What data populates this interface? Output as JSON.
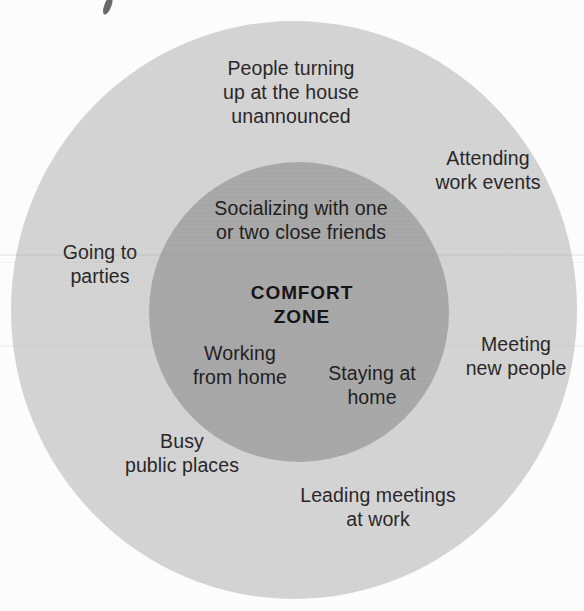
{
  "figure": {
    "type": "concentric-circle-diagram",
    "title": "COMFORT ZONE",
    "colors": {
      "background": "#ffffff",
      "outer_ring_fill": "#d5d5d5",
      "inner_circle_fill": "#a9a9a9",
      "text": "#231f20"
    }
  },
  "center_label": "COMFORT\nZONE",
  "inner_zone": {
    "name": "COMFORT ZONE",
    "items": [
      {
        "id": "socializing",
        "text": "Socializing with one\nor two close friends"
      },
      {
        "id": "working-from-home",
        "text": "Working\nfrom home"
      },
      {
        "id": "staying-at-home",
        "text": "Staying at\nhome"
      }
    ]
  },
  "outer_zone": {
    "items": [
      {
        "id": "people-turning-up",
        "text": "People turning\nup at the house\nunannounced"
      },
      {
        "id": "attending-work-events",
        "text": "Attending\nwork events"
      },
      {
        "id": "going-to-parties",
        "text": "Going to\nparties"
      },
      {
        "id": "meeting-new-people",
        "text": "Meeting\nnew people"
      },
      {
        "id": "busy-public-places",
        "text": "Busy\npublic places"
      },
      {
        "id": "leading-meetings",
        "text": "Leading meetings\nat work"
      }
    ]
  },
  "chart_data": {
    "type": "diagram",
    "title": "COMFORT ZONE",
    "rings": [
      {
        "name": "Comfort zone (inner circle)",
        "fill": "#a9a9a9",
        "center": [
          299,
          312
        ],
        "radius": 150,
        "labels": [
          "Socializing with one or two close friends",
          "COMFORT ZONE",
          "Working from home",
          "Staying at home"
        ]
      },
      {
        "name": "Outside comfort zone (outer circle)",
        "fill": "#d5d5d5",
        "center": [
          294,
          310
        ],
        "radius": 283,
        "labels": [
          "People turning up at the house unannounced",
          "Attending work events",
          "Going to parties",
          "Meeting new people",
          "Busy public places",
          "Leading meetings at work"
        ]
      }
    ]
  }
}
